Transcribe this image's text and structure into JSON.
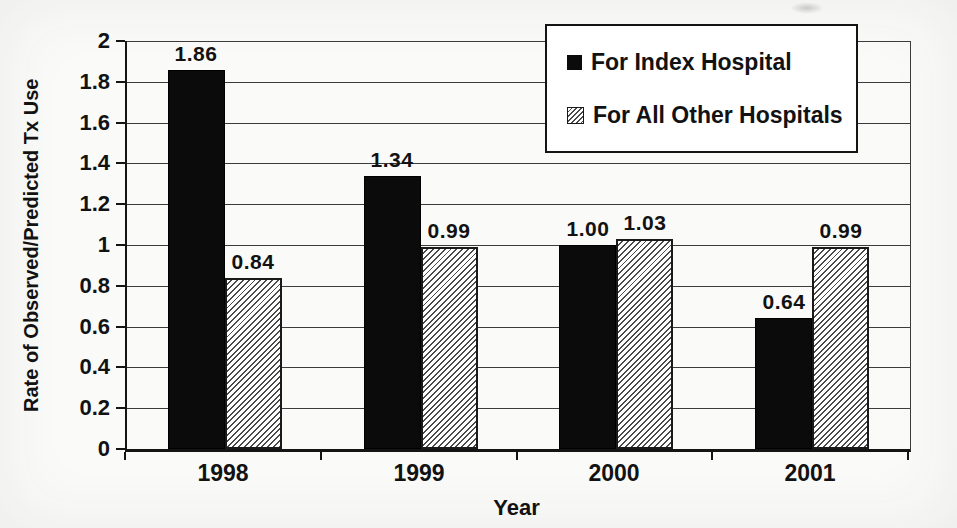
{
  "legend": {
    "items": [
      {
        "label": "For Index Hospital",
        "swatch": "solid-black"
      },
      {
        "label": "For All Other Hospitals",
        "swatch": "diagonal-hatch"
      }
    ]
  },
  "chart_data": {
    "type": "bar",
    "title": "",
    "xlabel": "Year",
    "ylabel": "Rate of Observed/Predicted Tx Use",
    "categories": [
      "1998",
      "1999",
      "2000",
      "2001"
    ],
    "series": [
      {
        "name": "For Index Hospital",
        "style": "solid",
        "color": "#0b0b0b",
        "values": [
          1.86,
          1.34,
          1.0,
          0.64
        ]
      },
      {
        "name": "For All Other Hospitals",
        "style": "hatch",
        "color": "#ffffff",
        "values": [
          0.84,
          0.99,
          1.03,
          0.99
        ]
      }
    ],
    "data_labels": [
      [
        "1.86",
        "1.34",
        "1.00",
        "0.64"
      ],
      [
        "0.84",
        "0.99",
        "1.03",
        "0.99"
      ]
    ],
    "ylim": [
      0,
      2
    ],
    "ytick_step": 0.2,
    "yticks": [
      "0",
      "0.2",
      "0.4",
      "0.6",
      "0.8",
      "1",
      "1.2",
      "1.4",
      "1.6",
      "1.8",
      "2"
    ],
    "grid": true,
    "legend_position": "top-right-inside"
  }
}
